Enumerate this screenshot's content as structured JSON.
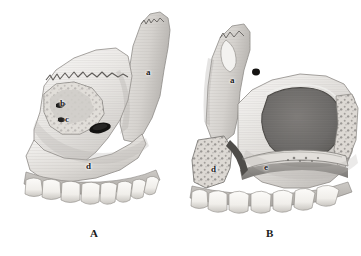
{
  "figure": {
    "type": "anatomical-illustration",
    "style": "grayscale watercolor medical drawing",
    "background_color": "#ffffff",
    "ink_color": "#1a1a1a",
    "bone_light": "#f2f1ef",
    "bone_mid": "#d7d5d2",
    "bone_shadow": "#a8a6a3",
    "cavity_dark": "#6e6c6a",
    "foramen_black": "#161616",
    "tooth_color": "#f7f6f3",
    "caption_text": ""
  },
  "panels": [
    {
      "id": "A",
      "caption": "A",
      "caption_x": 90,
      "caption_y": 228,
      "labels": [
        {
          "key": "a",
          "text": "a",
          "x": 146,
          "y": 68
        },
        {
          "key": "b",
          "text": "b",
          "x": 60,
          "y": 99
        },
        {
          "key": "c",
          "text": "c",
          "x": 65,
          "y": 115
        },
        {
          "key": "d",
          "text": "d",
          "x": 86,
          "y": 162
        }
      ]
    },
    {
      "id": "B",
      "caption": "B",
      "caption_x": 266,
      "caption_y": 228,
      "labels": [
        {
          "key": "a",
          "text": "a",
          "x": 230,
          "y": 76
        },
        {
          "key": "d",
          "text": "d",
          "x": 211,
          "y": 165
        },
        {
          "key": "e",
          "text": "e",
          "x": 264,
          "y": 163
        }
      ]
    }
  ],
  "teeth": {
    "panel_a_count": 8,
    "panel_b_count": 7
  }
}
